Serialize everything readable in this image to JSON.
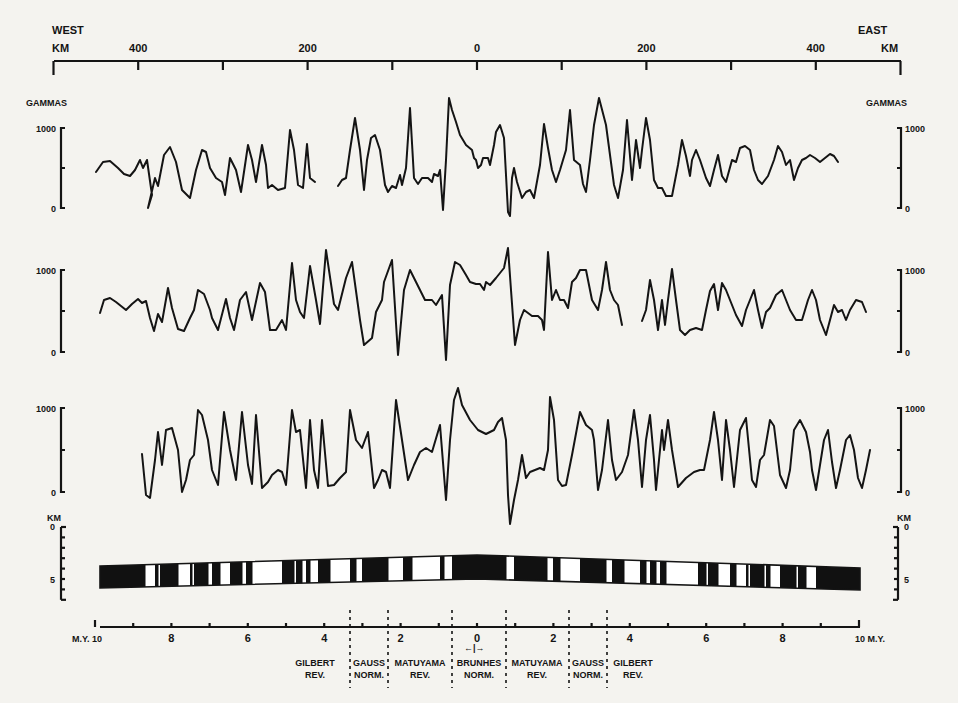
{
  "chart_data": {
    "type": "line",
    "top_axis": {
      "left_label": "WEST",
      "right_label": "EAST",
      "unit_left": "KM",
      "unit_right": "KM",
      "ticks": [
        -500,
        -400,
        -300,
        -200,
        -100,
        0,
        100,
        200,
        300,
        400,
        500
      ],
      "tick_labels": [
        {
          "value": -400,
          "label": "400"
        },
        {
          "value": -200,
          "label": "200"
        },
        {
          "value": 0,
          "label": "0"
        },
        {
          "value": 200,
          "label": "200"
        },
        {
          "value": 400,
          "label": "400"
        }
      ],
      "range_km": [
        -500,
        500
      ]
    },
    "profiles": [
      {
        "name": "Observed profile (upper)",
        "ylabel": "GAMMAS",
        "ylim": [
          0,
          1000
        ],
        "tick_labels": [
          "0",
          "1000"
        ],
        "segments": [
          "96,172 103,162 110,161 118,168 124,174 130,176 135,170 140,160 143,168 147,160 152,195 148,208 155,178 158,186 164,155 170,147 176,162 182,190 190,198 196,170 202,150 206,152 210,168 216,178 222,182 225,195 230,158 236,170 241,192 248,145 252,160 256,182 262,145 266,165 268,188 272,185 278,190 285,188 290,130 294,150 298,185 303,188 307,144 310,178 315,182",
          "338,186 342,180 346,178 350,150 355,118 360,150 364,190 367,160 371,138 375,135 380,150 385,185 388,192 392,186 396,188 400,175 402,185 406,168 410,108 414,178 418,184 422,178 428,178 432,182 434,174 438,176 440,170 443,210 446,160 449,98 452,110 456,122 460,135 466,145 472,150 474,158 476,160 478,168 481,165 483,158 488,158 490,165 494,145 496,132 500,125 504,138 508,212 510,216 512,178 514,168 517,182 522,198 526,192 530,190 534,198 540,165 544,124 548,148 552,170 556,182 560,170 566,150 570,110 574,160 580,165 583,184 586,192 590,160 594,125 599,98 606,125 612,170 614,185 618,198 623,170 627,120 632,180 636,140 640,168 642,150 646,118 650,140 654,180 658,188 662,188 666,196 672,196 678,165 682,140 686,156 690,176 692,160 696,150 700,160 706,178 710,186 714,170 718,155 722,176 726,182 732,160 736,162 740,148 745,146 750,150 754,170 758,180 762,184 768,176 774,160 778,146 782,152 786,165 790,160 794,180 798,168 802,160 806,158 810,155 815,158 820,162 825,158 830,154 834,156 838,162"
        ],
        "frame": {
          "y1000": 128,
          "y0": 208
        }
      },
      {
        "name": "Observed profile (middle)",
        "ylabel": "",
        "ylim": [
          0,
          1000
        ],
        "tick_labels": [
          "0",
          "1000"
        ],
        "segments": [
          "100,313 104,300 110,298 116,302 121,306 126,310 132,304 138,299 142,303 146,301 150,318 154,331 158,314 162,322 168,288 172,308 178,329 184,331 190,318 194,310 198,290 204,294 210,310 212,318 218,330 226,299 230,318 234,330 240,300 246,292 252,320 260,283 265,292 270,330 276,330 282,320 286,330 292,263 296,300 300,312 304,318 310,266 316,300 320,324 326,250 334,304 338,310 346,278 352,262 360,320 364,345 372,338 376,312 382,300 384,282 392,260 398,355 404,290 410,270 416,282 420,290 425,300 432,300 436,305 442,295 446,360 450,285 455,262 460,265 466,275 470,282 476,284 480,284 484,290 486,282 490,285 496,278 500,273 504,268 508,248 511,290 515,345 520,320 524,310 528,313 532,316 538,316 542,320 544,330 548,252 552,300 556,290 560,300 564,300 568,308 572,282 576,278 580,270 586,270 592,300 598,310 602,290 606,262 610,290 614,300 618,305 622,325",
          "642,321 646,310 650,280 654,300 658,330 662,300 665,325 668,300 672,269 676,300 680,330 685,335 690,330 696,328 702,330 706,310 710,291 714,284 718,310 722,283 726,290 730,300 736,315 742,326 746,310 750,300 754,290 758,310 762,328 766,312 770,308 776,295 782,290 786,300 790,310 796,320 802,320 808,300 812,290 816,300 820,320 826,335 830,320 834,305 838,312 842,310 846,320 850,310 856,300 862,302 866,312"
        ],
        "frame": {
          "y1000": 270,
          "y0": 352
        }
      },
      {
        "name": "Computed profile (lower)",
        "ylabel": "",
        "ylim": [
          0,
          1000
        ],
        "tick_labels": [
          "0",
          "1000"
        ],
        "segments": [
          "142,454 146,495 150,498 155,460 158,432 162,465 166,430 172,428 178,450 182,492 186,480 190,460 194,455 198,410 202,415 208,440 212,470 218,485 224,412 230,450 236,480 242,412 248,465 252,484 256,415 262,488 268,482 272,475 278,470 282,472 286,485 292,410 296,432 300,430 306,488 310,420 314,470 318,488 322,420 328,486 334,485 340,478 346,472 350,410 356,440 362,448 368,432 374,488 378,480 382,470 386,472 390,488 396,400 402,440 408,480 414,465 420,452 426,448 432,452 440,425 446,500 450,440 454,400 458,388 462,405 470,420 478,430 486,434 494,430 498,422 502,418 506,440 508,495 510,524 514,500 518,480 522,455 526,478 530,472 540,468 544,470 548,450 550,397 554,420 558,480 562,486 566,485 572,455 580,412 586,425 592,430 594,440 598,490 602,470 608,420 612,460 616,480 622,472 628,455 634,410 638,440 642,487 646,440 650,415 654,460 656,490 662,430 664,450 668,420 672,450 678,487 686,478 694,472 700,470 704,470 710,440 714,412 718,440 722,480 726,420 730,450 734,487 740,430 746,418 752,480 756,487 760,460 764,455 770,420 774,426 780,475 786,488 790,470 794,430 800,420 806,432 810,452 812,470 816,490 820,465 824,440 828,430 832,462 836,488 840,470 846,440 850,435 854,450 858,478 862,488 866,470 870,450"
        ],
        "frame": {
          "y1000": 408,
          "y0": 492
        }
      }
    ],
    "depth_model": {
      "ylabel": "KM",
      "tick_labels": [
        "0",
        "5"
      ],
      "polarity_legend": {
        "normal": "black",
        "reversed": "white"
      },
      "blocks_x": [
        {
          "x0": 100,
          "x1": 145,
          "pol": "N"
        },
        {
          "x0": 145,
          "x1": 155,
          "pol": "R"
        },
        {
          "x0": 155,
          "x1": 158,
          "pol": "N"
        },
        {
          "x0": 158,
          "x1": 160,
          "pol": "R"
        },
        {
          "x0": 160,
          "x1": 178,
          "pol": "N"
        },
        {
          "x0": 178,
          "x1": 190,
          "pol": "R"
        },
        {
          "x0": 190,
          "x1": 192,
          "pol": "N"
        },
        {
          "x0": 192,
          "x1": 194,
          "pol": "R"
        },
        {
          "x0": 194,
          "x1": 208,
          "pol": "N"
        },
        {
          "x0": 208,
          "x1": 212,
          "pol": "R"
        },
        {
          "x0": 212,
          "x1": 220,
          "pol": "N"
        },
        {
          "x0": 220,
          "x1": 230,
          "pol": "R"
        },
        {
          "x0": 230,
          "x1": 242,
          "pol": "N"
        },
        {
          "x0": 242,
          "x1": 246,
          "pol": "R"
        },
        {
          "x0": 246,
          "x1": 252,
          "pol": "N"
        },
        {
          "x0": 252,
          "x1": 282,
          "pol": "R"
        },
        {
          "x0": 282,
          "x1": 294,
          "pol": "N"
        },
        {
          "x0": 294,
          "x1": 296,
          "pol": "R"
        },
        {
          "x0": 296,
          "x1": 302,
          "pol": "N"
        },
        {
          "x0": 302,
          "x1": 306,
          "pol": "R"
        },
        {
          "x0": 306,
          "x1": 310,
          "pol": "N"
        },
        {
          "x0": 310,
          "x1": 318,
          "pol": "R"
        },
        {
          "x0": 318,
          "x1": 330,
          "pol": "N"
        },
        {
          "x0": 330,
          "x1": 350,
          "pol": "R"
        },
        {
          "x0": 350,
          "x1": 356,
          "pol": "N"
        },
        {
          "x0": 356,
          "x1": 362,
          "pol": "R"
        },
        {
          "x0": 362,
          "x1": 388,
          "pol": "N"
        },
        {
          "x0": 388,
          "x1": 403,
          "pol": "R"
        },
        {
          "x0": 403,
          "x1": 412,
          "pol": "N"
        },
        {
          "x0": 412,
          "x1": 440,
          "pol": "R"
        },
        {
          "x0": 440,
          "x1": 444,
          "pol": "N"
        },
        {
          "x0": 444,
          "x1": 452,
          "pol": "R"
        },
        {
          "x0": 452,
          "x1": 506,
          "pol": "N"
        },
        {
          "x0": 506,
          "x1": 514,
          "pol": "R"
        },
        {
          "x0": 514,
          "x1": 547,
          "pol": "N"
        },
        {
          "x0": 547,
          "x1": 553,
          "pol": "R"
        },
        {
          "x0": 553,
          "x1": 560,
          "pol": "N"
        },
        {
          "x0": 560,
          "x1": 580,
          "pol": "R"
        },
        {
          "x0": 580,
          "x1": 606,
          "pol": "N"
        },
        {
          "x0": 606,
          "x1": 612,
          "pol": "R"
        },
        {
          "x0": 612,
          "x1": 624,
          "pol": "N"
        },
        {
          "x0": 624,
          "x1": 640,
          "pol": "R"
        },
        {
          "x0": 640,
          "x1": 646,
          "pol": "N"
        },
        {
          "x0": 646,
          "x1": 650,
          "pol": "R"
        },
        {
          "x0": 650,
          "x1": 656,
          "pol": "N"
        },
        {
          "x0": 656,
          "x1": 660,
          "pol": "R"
        },
        {
          "x0": 660,
          "x1": 666,
          "pol": "N"
        },
        {
          "x0": 666,
          "x1": 698,
          "pol": "R"
        },
        {
          "x0": 698,
          "x1": 706,
          "pol": "N"
        },
        {
          "x0": 706,
          "x1": 708,
          "pol": "R"
        },
        {
          "x0": 708,
          "x1": 718,
          "pol": "N"
        },
        {
          "x0": 718,
          "x1": 730,
          "pol": "R"
        },
        {
          "x0": 730,
          "x1": 736,
          "pol": "N"
        },
        {
          "x0": 736,
          "x1": 746,
          "pol": "R"
        },
        {
          "x0": 746,
          "x1": 748,
          "pol": "N"
        },
        {
          "x0": 748,
          "x1": 750,
          "pol": "R"
        },
        {
          "x0": 750,
          "x1": 764,
          "pol": "N"
        },
        {
          "x0": 764,
          "x1": 766,
          "pol": "R"
        },
        {
          "x0": 766,
          "x1": 770,
          "pol": "N"
        },
        {
          "x0": 770,
          "x1": 780,
          "pol": "R"
        },
        {
          "x0": 780,
          "x1": 796,
          "pol": "N"
        },
        {
          "x0": 796,
          "x1": 798,
          "pol": "R"
        },
        {
          "x0": 798,
          "x1": 806,
          "pol": "N"
        },
        {
          "x0": 806,
          "x1": 816,
          "pol": "R"
        },
        {
          "x0": 816,
          "x1": 860,
          "pol": "N"
        }
      ]
    },
    "time_axis": {
      "unit_left": "M.Y.",
      "unit_right": "M.Y.",
      "range_my": [
        -10,
        10
      ],
      "tick_labels": [
        {
          "value": -10,
          "label": "10"
        },
        {
          "value": -8,
          "label": "8"
        },
        {
          "value": -6,
          "label": "6"
        },
        {
          "value": -4,
          "label": "4"
        },
        {
          "value": -2,
          "label": "2"
        },
        {
          "value": 0,
          "label": "0"
        },
        {
          "value": 2,
          "label": "2"
        },
        {
          "value": 4,
          "label": "4"
        },
        {
          "value": 6,
          "label": "6"
        },
        {
          "value": 8,
          "label": "8"
        },
        {
          "value": 10,
          "label": "10"
        }
      ]
    },
    "epochs": [
      {
        "name": "GILBERT",
        "polarity": "REV.",
        "side": "west"
      },
      {
        "name": "GAUSS",
        "polarity": "NORM.",
        "side": "west"
      },
      {
        "name": "MATUYAMA",
        "polarity": "REV.",
        "side": "west"
      },
      {
        "name": "BRUNHES",
        "polarity": "NORM.",
        "side": "center"
      },
      {
        "name": "MATUYAMA",
        "polarity": "REV.",
        "side": "east"
      },
      {
        "name": "GAUSS",
        "polarity": "NORM.",
        "side": "east"
      },
      {
        "name": "GILBERT",
        "polarity": "REV.",
        "side": "east"
      }
    ]
  },
  "labels": {
    "west": "WEST",
    "east": "EAST",
    "km": "KM",
    "gammas": "GAMMAS",
    "g1000": "1000",
    "g0": "0",
    "depth_0": "0",
    "depth_5": "5",
    "my_left": "M.Y. 10",
    "my_right": "10 M.Y.",
    "brunhes_arrow": "←|→"
  }
}
